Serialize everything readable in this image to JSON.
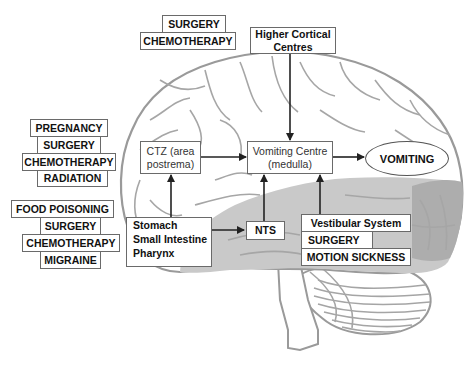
{
  "diagram": {
    "type": "pathway-diagram",
    "background_image": "brain-lateral-view",
    "colors": {
      "brain_fill": "#ffffff",
      "brain_lower_fill": "#c8c8c8",
      "brain_occipital_fill": "#a8a8a8",
      "outline": "#9a9a9a",
      "box_border": "#6a6a6a",
      "arrow": "#222222"
    },
    "trigger_groups": {
      "top": [
        "SURGERY",
        "CHEMOTHERAPY"
      ],
      "left_upper": [
        "PREGNANCY",
        "SURGERY",
        "CHEMOTHERAPY",
        "RADIATION"
      ],
      "left_lower": [
        "FOOD POISONING",
        "SURGERY",
        "CHEMOTHERAPY",
        "MIGRAINE"
      ],
      "vestibular": [
        "Vestibular System",
        "SURGERY",
        "MOTION SICKNESS"
      ]
    },
    "nodes": {
      "higher_cortical": {
        "line1": "Higher Cortical",
        "line2": "Centres"
      },
      "ctz": {
        "line1": "CTZ (area",
        "line2": "postrema)"
      },
      "vomiting_centre": {
        "line1": "Vomiting Centre",
        "line2": "(medulla)"
      },
      "vomiting": "VOMITING",
      "gut": {
        "line1": "Stomach",
        "line2": "Small Intestine",
        "line3": "Pharynx"
      },
      "nts": "NTS"
    },
    "edges": [
      {
        "from": "Higher Cortical Centres",
        "to": "Vomiting Centre (medulla)"
      },
      {
        "from": "CTZ (area postrema)",
        "to": "Vomiting Centre (medulla)"
      },
      {
        "from": "Vomiting Centre (medulla)",
        "to": "VOMITING"
      },
      {
        "from": "Stomach / Small Intestine / Pharynx",
        "to": "CTZ (area postrema)"
      },
      {
        "from": "Stomach / Small Intestine / Pharynx",
        "to": "NTS"
      },
      {
        "from": "NTS",
        "to": "Vomiting Centre (medulla)"
      },
      {
        "from": "Vestibular System",
        "to": "Vomiting Centre (medulla)"
      }
    ]
  }
}
